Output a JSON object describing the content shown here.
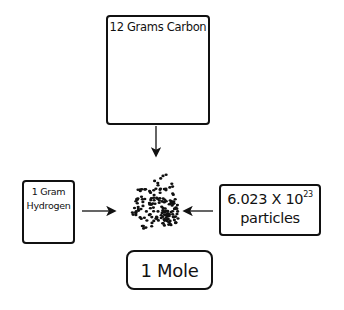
{
  "diagram": {
    "carbon_box": {
      "title": "12 Grams Carbon",
      "weight_rows": [
        3,
        4,
        5
      ]
    },
    "hydrogen_box": {
      "line1": "1 Gram",
      "line2": "Hydrogen",
      "weight_count": 1
    },
    "particles_box": {
      "number": "6.023 X 10",
      "exponent": "23",
      "unit": "particles"
    },
    "result_box": {
      "label": "1 Mole"
    },
    "arrows": [
      "carbon-to-mole",
      "hydrogen-to-mole",
      "particles-to-mole"
    ],
    "center_icon": "particle-cluster"
  }
}
